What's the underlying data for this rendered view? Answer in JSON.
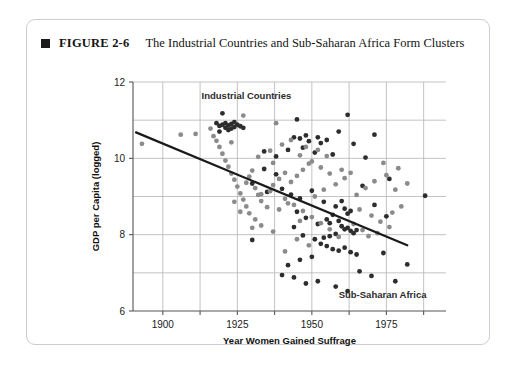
{
  "figure": {
    "marker_icon": "filled-square-icon",
    "number_label": "FIGURE 2-6",
    "title": "The Industrial Countries and Sub-Saharan Africa Form Clusters"
  },
  "colors": {
    "dark_point": "#2d2d2d",
    "gray_point": "#8b8b8b",
    "trend_line": "#1a1a1a",
    "grid": "#b4b4b4",
    "axis": "#555555",
    "card_border": "#c9cdd2",
    "background": "#ffffff"
  },
  "chart_data": {
    "type": "scatter",
    "title": "The Industrial Countries and Sub-Saharan Africa Form Clusters",
    "xlabel": "Year Women Gained Suffrage",
    "ylabel": "GDP per Capita (logged)",
    "xlim": [
      1890,
      1995
    ],
    "ylim": [
      6,
      12
    ],
    "xticks": [
      1900,
      1925,
      1950,
      1975
    ],
    "xtick_labels": [
      "1900",
      "1925",
      "1950",
      "1975"
    ],
    "x_gridlines": [
      1900,
      1912.5,
      1925,
      1937.5,
      1950,
      1962.5,
      1975,
      1987.5
    ],
    "yticks": [
      6,
      8,
      10,
      12
    ],
    "ytick_labels": [
      "6",
      "8",
      "10",
      "12"
    ],
    "y_gridlines": [
      7,
      8,
      9,
      10,
      11
    ],
    "grid": true,
    "legend": "none",
    "annotations": [
      {
        "text": "Industrial Countries",
        "x": 1913,
        "y": 11.55,
        "anchor": "start"
      },
      {
        "text": "Sub-Saharan Africa",
        "x": 1959,
        "y": 6.35,
        "anchor": "start"
      }
    ],
    "trend_line": {
      "name": "Fitted regression line",
      "x": [
        1891,
        1982
      ],
      "y": [
        10.68,
        7.72
      ]
    },
    "series": [
      {
        "name": "Dark markers",
        "color": "#2d2d2d",
        "points": [
          [
            1918,
            10.92
          ],
          [
            1919,
            10.85
          ],
          [
            1919,
            10.7
          ],
          [
            1920,
            10.88
          ],
          [
            1921,
            10.8
          ],
          [
            1921,
            10.92
          ],
          [
            1922,
            10.86
          ],
          [
            1922,
            10.74
          ],
          [
            1923,
            10.9
          ],
          [
            1923,
            10.78
          ],
          [
            1924,
            10.95
          ],
          [
            1924,
            10.82
          ],
          [
            1925,
            10.88
          ],
          [
            1926,
            10.84
          ],
          [
            1927,
            10.8
          ],
          [
            1920,
            11.18
          ],
          [
            1945,
            11.02
          ],
          [
            1944,
            10.55
          ],
          [
            1946,
            10.52
          ],
          [
            1948,
            10.6
          ],
          [
            1949,
            10.45
          ],
          [
            1952,
            10.55
          ],
          [
            1953,
            10.4
          ],
          [
            1955,
            10.48
          ],
          [
            1962,
            11.14
          ],
          [
            1959,
            10.7
          ],
          [
            1964,
            10.38
          ],
          [
            1971,
            10.62
          ],
          [
            1934,
            10.18
          ],
          [
            1938,
            10.05
          ],
          [
            1942,
            10.22
          ],
          [
            1947,
            10.28
          ],
          [
            1951,
            10.15
          ],
          [
            1957,
            10.1
          ],
          [
            1968,
            10.02
          ],
          [
            1976,
            9.46
          ],
          [
            1930,
            7.86
          ],
          [
            1935,
            9.12
          ],
          [
            1940,
            9.2
          ],
          [
            1943,
            9.05
          ],
          [
            1946,
            8.95
          ],
          [
            1950,
            9.15
          ],
          [
            1954,
            8.86
          ],
          [
            1958,
            8.74
          ],
          [
            1960,
            8.88
          ],
          [
            1961,
            8.68
          ],
          [
            1962,
            8.55
          ],
          [
            1963,
            8.62
          ],
          [
            1957,
            8.52
          ],
          [
            1955,
            8.4
          ],
          [
            1956,
            8.3
          ],
          [
            1959,
            8.36
          ],
          [
            1960,
            8.22
          ],
          [
            1961,
            8.14
          ],
          [
            1962,
            8.18
          ],
          [
            1963,
            8.1
          ],
          [
            1964,
            8.04
          ],
          [
            1965,
            8.12
          ],
          [
            1958,
            8.02
          ],
          [
            1956,
            7.96
          ],
          [
            1954,
            7.92
          ],
          [
            1952,
            8.28
          ],
          [
            1948,
            8.44
          ],
          [
            1945,
            8.6
          ],
          [
            1944,
            8.2
          ],
          [
            1947,
            7.98
          ],
          [
            1951,
            7.88
          ],
          [
            1953,
            7.76
          ],
          [
            1955,
            7.7
          ],
          [
            1957,
            7.62
          ],
          [
            1959,
            7.58
          ],
          [
            1961,
            7.66
          ],
          [
            1963,
            7.54
          ],
          [
            1965,
            7.48
          ],
          [
            1950,
            7.42
          ],
          [
            1946,
            7.34
          ],
          [
            1942,
            7.2
          ],
          [
            1940,
            6.94
          ],
          [
            1944,
            6.88
          ],
          [
            1948,
            6.72
          ],
          [
            1952,
            6.78
          ],
          [
            1958,
            6.64
          ],
          [
            1962,
            6.52
          ],
          [
            1966,
            7.04
          ],
          [
            1970,
            6.92
          ],
          [
            1974,
            7.52
          ],
          [
            1978,
            6.78
          ],
          [
            1982,
            7.22
          ],
          [
            1988,
            9.02
          ],
          [
            1975,
            8.48
          ],
          [
            1971,
            8.78
          ],
          [
            1967,
            9.28
          ],
          [
            1938,
            9.58
          ],
          [
            1934,
            9.72
          ],
          [
            1930,
            9.34
          ]
        ]
      },
      {
        "name": "Gray markers",
        "color": "#8b8b8b",
        "points": [
          [
            1893,
            10.38
          ],
          [
            1906,
            10.62
          ],
          [
            1911,
            10.64
          ],
          [
            1916,
            10.78
          ],
          [
            1927,
            11.12
          ],
          [
            1938,
            10.92
          ],
          [
            1917,
            10.58
          ],
          [
            1918,
            10.46
          ],
          [
            1919,
            10.3
          ],
          [
            1920,
            10.12
          ],
          [
            1921,
            9.94
          ],
          [
            1922,
            9.78
          ],
          [
            1923,
            9.6
          ],
          [
            1924,
            9.44
          ],
          [
            1925,
            9.26
          ],
          [
            1926,
            9.08
          ],
          [
            1927,
            8.92
          ],
          [
            1928,
            9.36
          ],
          [
            1929,
            9.52
          ],
          [
            1930,
            9.68
          ],
          [
            1931,
            9.22
          ],
          [
            1932,
            9.04
          ],
          [
            1933,
            8.88
          ],
          [
            1935,
            8.72
          ],
          [
            1936,
            9.14
          ],
          [
            1937,
            9.3
          ],
          [
            1939,
            9.46
          ],
          [
            1941,
            9.62
          ],
          [
            1943,
            9.38
          ],
          [
            1945,
            9.54
          ],
          [
            1947,
            9.7
          ],
          [
            1949,
            9.86
          ],
          [
            1932,
            10.04
          ],
          [
            1936,
            10.2
          ],
          [
            1940,
            10.36
          ],
          [
            1943,
            10.48
          ],
          [
            1946,
            10.08
          ],
          [
            1950,
            9.92
          ],
          [
            1953,
            9.76
          ],
          [
            1956,
            9.6
          ],
          [
            1941,
            8.94
          ],
          [
            1944,
            8.78
          ],
          [
            1947,
            8.62
          ],
          [
            1950,
            8.46
          ],
          [
            1953,
            8.3
          ],
          [
            1956,
            8.14
          ],
          [
            1929,
            8.56
          ],
          [
            1931,
            8.4
          ],
          [
            1933,
            8.24
          ],
          [
            1937,
            8.08
          ],
          [
            1939,
            8.66
          ],
          [
            1942,
            8.82
          ],
          [
            1928,
            8.74
          ],
          [
            1926,
            8.6
          ],
          [
            1924,
            8.86
          ],
          [
            1946,
            8.36
          ],
          [
            1951,
            9.0
          ],
          [
            1954,
            9.18
          ],
          [
            1958,
            9.32
          ],
          [
            1961,
            9.48
          ],
          [
            1965,
            9.04
          ],
          [
            1968,
            9.22
          ],
          [
            1971,
            9.4
          ],
          [
            1975,
            9.56
          ],
          [
            1978,
            9.18
          ],
          [
            1982,
            9.34
          ],
          [
            1966,
            8.66
          ],
          [
            1970,
            8.5
          ],
          [
            1973,
            8.34
          ],
          [
            1977,
            8.58
          ],
          [
            1980,
            8.74
          ],
          [
            1964,
            8.28
          ],
          [
            1967,
            8.12
          ],
          [
            1969,
            7.96
          ],
          [
            1972,
            8.04
          ],
          [
            1976,
            8.2
          ],
          [
            1945,
            7.88
          ],
          [
            1949,
            7.72
          ],
          [
            1941,
            7.56
          ],
          [
            1937,
            9.88
          ],
          [
            1933,
            9.06
          ],
          [
            1948,
            10.3
          ],
          [
            1952,
            10.22
          ],
          [
            1955,
            10.06
          ],
          [
            1960,
            9.7
          ],
          [
            1963,
            9.62
          ],
          [
            1974,
            9.88
          ],
          [
            1979,
            9.74
          ],
          [
            1923,
            10.42
          ],
          [
            1930,
            8.18
          ],
          [
            1959,
            7.94
          ]
        ]
      }
    ]
  }
}
